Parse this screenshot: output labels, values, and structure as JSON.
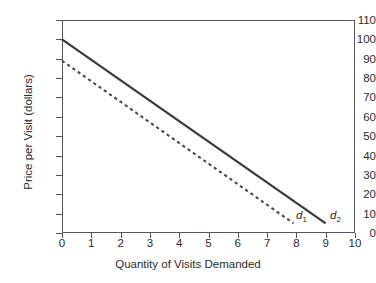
{
  "chart_data": {
    "type": "line",
    "title": "",
    "xlabel": "Quantity of Visits Demanded",
    "ylabel": "Price per Visit (dollars)",
    "xlim": [
      0,
      10
    ],
    "ylim": [
      0,
      110
    ],
    "xticks": [
      "0",
      "1",
      "2",
      "3",
      "4",
      "5",
      "6",
      "7",
      "8",
      "9",
      "10"
    ],
    "yticks": [
      "0",
      "10",
      "20",
      "30",
      "40",
      "50",
      "60",
      "70",
      "80",
      "90",
      "100",
      "110"
    ],
    "grid": false,
    "legend_position": "inline-end-of-curve",
    "series": [
      {
        "name": "d1",
        "label": "d",
        "subscript": "1",
        "style": "dashed",
        "color": "#4a4b4f",
        "points": [
          [
            0,
            89
          ],
          [
            7.9,
            5
          ]
        ]
      },
      {
        "name": "d2",
        "label": "d",
        "subscript": "2",
        "style": "solid",
        "color": "#3a3b3f",
        "points": [
          [
            0,
            100
          ],
          [
            9,
            5
          ]
        ]
      }
    ]
  },
  "axes": {
    "y_axis_title": "Price per Visit (dollars)",
    "x_axis_title": "Quantity of Visits Demanded"
  },
  "colors": {
    "background": "#ffffff",
    "frame": "#55565a",
    "solid_curve": "#3a3b3f",
    "dashed_curve": "#4a4b4f",
    "text": "#2b2b2b"
  }
}
